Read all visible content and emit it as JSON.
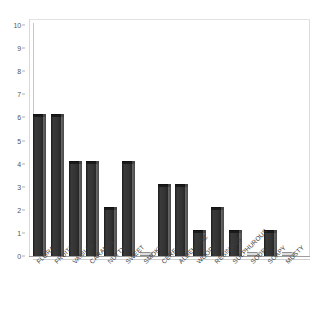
{
  "chart_data": {
    "type": "bar",
    "title": "",
    "subtitle": "",
    "xlabel": "",
    "ylabel": "",
    "ylim": [
      0,
      10
    ],
    "ytick_step": 1,
    "yticks": [
      0,
      1,
      2,
      3,
      4,
      5,
      6,
      7,
      8,
      9,
      10
    ],
    "grid": false,
    "legend": false,
    "legend_position": "none",
    "xtick_rotation": -45,
    "bar_style": "3d-column",
    "categories": [
      "FLORAL",
      "FRUITY",
      "VANILLA",
      "CARAMEL",
      "NUTTY",
      "SWEET",
      "SMOKY",
      "CEREAL",
      "ALDEHYDIC",
      "WOODY",
      "RESINOUS",
      "SULPHUROUS",
      "SOUR",
      "SOAPY",
      "MUSTY"
    ],
    "values": [
      6,
      6,
      4,
      4,
      2,
      4,
      0,
      3,
      3,
      1,
      2,
      1,
      0,
      1,
      0
    ]
  },
  "colors": {
    "bar_fill": "#333333",
    "bar_top_face": "#1a1a1a",
    "bar_side_face": "#5d5d5d",
    "plot_background": "#ffffff",
    "frame_line": "#c8c8c8",
    "axis_line": "#9e9e9e",
    "tick_label": "#555555",
    "category_label": "#3b3b3b"
  }
}
